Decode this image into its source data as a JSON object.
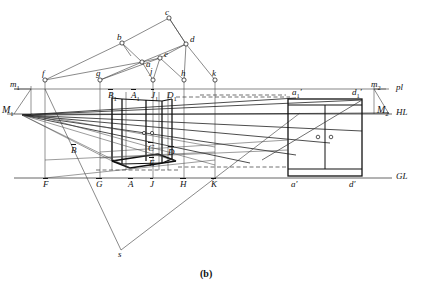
{
  "figure": {
    "caption": "(b)",
    "type": "perspective-construction-drawing"
  },
  "reference_lines": [
    {
      "name": "pl",
      "label": "pl",
      "y": 89,
      "role": "picture-plane-line"
    },
    {
      "name": "HL",
      "label": "HL",
      "y": 114,
      "role": "horizon-line"
    },
    {
      "name": "GL",
      "label": "GL",
      "y": 178,
      "role": "ground-line"
    }
  ],
  "measuring_points": [
    {
      "name": "m1",
      "label": "m",
      "sub": "1",
      "x": 14,
      "y": 86
    },
    {
      "name": "M1",
      "label": "M",
      "sub": "1",
      "x": 7,
      "y": 112
    },
    {
      "name": "m2",
      "label": "m",
      "sub": "2",
      "x": 374,
      "y": 86
    },
    {
      "name": "M2",
      "label": "M",
      "sub": "2",
      "x": 381,
      "y": 112
    }
  ],
  "plan_points": [
    {
      "name": "a",
      "label": "a",
      "x": 142,
      "y": 62
    },
    {
      "name": "b",
      "label": "b",
      "x": 122,
      "y": 43
    },
    {
      "name": "c",
      "label": "c",
      "x": 169,
      "y": 18
    },
    {
      "name": "d",
      "label": "d",
      "x": 186,
      "y": 44
    },
    {
      "name": "e",
      "label": "e",
      "x": 160,
      "y": 58
    },
    {
      "name": "f",
      "label": "f",
      "x": 45,
      "y": 80
    },
    {
      "name": "g",
      "label": "g",
      "x": 100,
      "y": 80
    },
    {
      "name": "j",
      "label": "j",
      "x": 153,
      "y": 80
    },
    {
      "name": "h",
      "label": "h",
      "x": 184,
      "y": 80
    },
    {
      "name": "k",
      "label": "k",
      "x": 215,
      "y": 80
    }
  ],
  "pl_labels": [
    {
      "name": "B1",
      "label": "B",
      "sub": "1",
      "over": true,
      "x": 110,
      "y": 95
    },
    {
      "name": "A1",
      "label": "A",
      "sub": "1",
      "over": true,
      "x": 133,
      "y": 95
    },
    {
      "name": "J1",
      "label": "J",
      "sub": "1",
      "over": true,
      "x": 153,
      "y": 95
    },
    {
      "name": "D1",
      "label": "D",
      "sub": "1",
      "over": false,
      "x": 169,
      "y": 95
    },
    {
      "name": "a1p",
      "label": "a",
      "sub": "1",
      "prime": true,
      "x": 296,
      "y": 93
    },
    {
      "name": "d1p",
      "label": "d",
      "sub": "1",
      "prime": true,
      "x": 355,
      "y": 93
    }
  ],
  "body_labels": [
    {
      "name": "B-bar",
      "label": "B",
      "over": true,
      "x": 73,
      "y": 150
    },
    {
      "name": "C-bar",
      "label": "C",
      "over": true,
      "x": 150,
      "y": 148
    },
    {
      "name": "D-bar",
      "label": "D",
      "over": true,
      "x": 170,
      "y": 152
    },
    {
      "name": "E-bar",
      "label": "E",
      "over": true,
      "x": 151,
      "y": 163
    }
  ],
  "gl_labels": [
    {
      "name": "F-bar",
      "label": "F",
      "over": true,
      "x": 46,
      "y": 182
    },
    {
      "name": "G-bar",
      "label": "G",
      "over": true,
      "x": 99,
      "y": 182
    },
    {
      "name": "A-bar",
      "label": "A",
      "over": true,
      "x": 131,
      "y": 182
    },
    {
      "name": "J-bar",
      "label": "J",
      "over": true,
      "x": 152,
      "y": 182
    },
    {
      "name": "H-bar",
      "label": "H",
      "over": true,
      "x": 183,
      "y": 182
    },
    {
      "name": "K-bar",
      "label": "K",
      "over": true,
      "x": 214,
      "y": 182
    },
    {
      "name": "ap",
      "label": "a",
      "prime": true,
      "x": 294,
      "y": 182
    },
    {
      "name": "dp",
      "label": "d",
      "prime": true,
      "x": 352,
      "y": 182
    }
  ],
  "station_point": {
    "name": "s",
    "label": "s",
    "x": 121,
    "y": 250
  },
  "colors": {
    "ink": "#1a1a1a",
    "thin": "#444444",
    "paper": "#ffffff",
    "construction": "#555555"
  },
  "elevation": {
    "name": "cabinet-elevation",
    "left_x": 288,
    "right_x": 362,
    "top_y": 99,
    "bottom_y": 176,
    "doors": 2,
    "handles": [
      {
        "x": 318,
        "y": 137
      },
      {
        "x": 331,
        "y": 137
      }
    ]
  },
  "perspective_box": {
    "name": "perspective-cabinet",
    "front_left_x": 112,
    "front_right_x": 168,
    "top_y": 98,
    "bottom_y": 168,
    "handles": [
      {
        "x": 144,
        "y": 133
      },
      {
        "x": 152,
        "y": 133
      }
    ]
  }
}
